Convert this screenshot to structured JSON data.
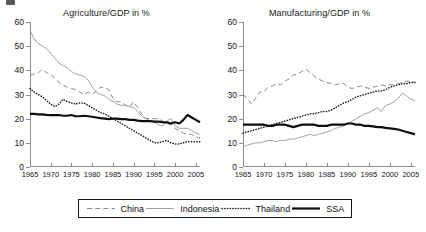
{
  "figure": {
    "caption_stub": "",
    "legend_position": "bottom-center-boxed"
  },
  "panels": [
    {
      "id": "agriculture",
      "title": "Agriculture/GDP in %"
    },
    {
      "id": "manufacturing",
      "title": "Manufacturing/GDP in %"
    }
  ],
  "legend": {
    "items": [
      {
        "label": "China",
        "style": "dashed"
      },
      {
        "label": "Indonesia",
        "style": "thin-solid"
      },
      {
        "label": "Thailand",
        "style": "dotted"
      },
      {
        "label": "SSA",
        "style": "thick-solid"
      }
    ]
  },
  "axis": {
    "y_ticks": [
      0,
      10,
      20,
      30,
      40,
      50,
      60
    ],
    "x_ticks": [
      1965,
      1970,
      1975,
      1980,
      1985,
      1990,
      1995,
      2000,
      2005
    ]
  },
  "colors": {
    "axis": "#8e8e8e",
    "china": "#7a7a7a",
    "indonesia": "#8a8a8a",
    "thailand": "#1a1a1a",
    "ssa": "#0d0d0d",
    "text": "#161616"
  },
  "chart_data": [
    {
      "type": "line",
      "title": "Agriculture/GDP in %",
      "xlabel": "",
      "ylabel": "",
      "xlim": [
        1965,
        2006
      ],
      "ylim": [
        0,
        60
      ],
      "grid": false,
      "legend": "bottom",
      "x": [
        1965,
        1966,
        1967,
        1968,
        1969,
        1970,
        1971,
        1972,
        1973,
        1974,
        1975,
        1976,
        1977,
        1978,
        1979,
        1980,
        1981,
        1982,
        1983,
        1984,
        1985,
        1986,
        1987,
        1988,
        1989,
        1990,
        1991,
        1992,
        1993,
        1994,
        1995,
        1996,
        1997,
        1998,
        1999,
        2000,
        2001,
        2002,
        2003,
        2004,
        2005,
        2006
      ],
      "series": [
        {
          "name": "China",
          "style": "dashed",
          "values": [
            38,
            38.5,
            39,
            40.5,
            39,
            38.5,
            36.5,
            35,
            34,
            33,
            32.5,
            32,
            31,
            30,
            31,
            30,
            31.5,
            33,
            33,
            32,
            28.5,
            27,
            27,
            25.5,
            25,
            27,
            24.5,
            22,
            20,
            20,
            20,
            20,
            19,
            18,
            17.5,
            16,
            15,
            14,
            13.5,
            13.5,
            12.5,
            12
          ]
        },
        {
          "name": "Indonesia",
          "style": "thin-solid",
          "values": [
            56.5,
            53,
            51,
            50,
            49,
            47,
            45,
            43,
            42,
            41,
            39.5,
            38.5,
            38,
            37.5,
            36,
            33,
            31,
            30,
            29.5,
            28,
            27,
            26,
            25.5,
            25.5,
            25,
            24.5,
            23,
            21,
            20,
            19,
            18.5,
            17.5,
            17,
            19,
            20,
            17,
            16,
            16,
            16,
            15,
            14,
            13.5
          ]
        },
        {
          "name": "Thailand",
          "style": "dotted",
          "values": [
            32.5,
            31,
            30,
            29,
            27.5,
            26,
            25,
            26,
            28,
            27,
            26.5,
            26,
            26.5,
            26.5,
            25.5,
            24.5,
            23.5,
            22.5,
            22,
            21,
            20,
            19,
            18,
            17,
            16,
            15,
            14,
            13,
            12,
            11,
            10,
            10,
            10.5,
            11,
            10,
            9.5,
            9.5,
            10,
            10.5,
            10.5,
            10.5,
            10.5
          ]
        },
        {
          "name": "SSA",
          "style": "thick-solid",
          "values": [
            22,
            22,
            21.8,
            21.8,
            21.6,
            21.5,
            21.5,
            21.5,
            21.2,
            21.2,
            21.5,
            21,
            21,
            21.2,
            21,
            20.8,
            20.5,
            20.2,
            20,
            19.8,
            20,
            20,
            19.8,
            19.8,
            19.5,
            19.5,
            19.2,
            19,
            19,
            19,
            18.8,
            18.8,
            18.5,
            18.5,
            18,
            18.5,
            18,
            19.5,
            21.5,
            20.5,
            19.5,
            18.5
          ]
        }
      ]
    },
    {
      "type": "line",
      "title": "Manufacturing/GDP in %",
      "xlabel": "",
      "ylabel": "",
      "xlim": [
        1965,
        2006
      ],
      "ylim": [
        0,
        60
      ],
      "grid": false,
      "legend": "bottom",
      "x": [
        1965,
        1966,
        1967,
        1968,
        1969,
        1970,
        1971,
        1972,
        1973,
        1974,
        1975,
        1976,
        1977,
        1978,
        1979,
        1980,
        1981,
        1982,
        1983,
        1984,
        1985,
        1986,
        1987,
        1988,
        1989,
        1990,
        1991,
        1992,
        1993,
        1994,
        1995,
        1996,
        1997,
        1998,
        1999,
        2000,
        2001,
        2002,
        2003,
        2004,
        2005,
        2006
      ],
      "series": [
        {
          "name": "China",
          "style": "dashed",
          "values": [
            30,
            28.5,
            26,
            28.5,
            31,
            31,
            33,
            33.5,
            34.5,
            34,
            35.5,
            36.5,
            38,
            38.5,
            39.5,
            40.5,
            39,
            37.5,
            36.5,
            35.5,
            35,
            34.5,
            34,
            34.5,
            34.5,
            33,
            32.5,
            33,
            33.5,
            33,
            32.5,
            33,
            33.5,
            34,
            33.5,
            34,
            34,
            34.5,
            35,
            35.5,
            35.5,
            35
          ]
        },
        {
          "name": "Indonesia",
          "style": "thin-solid",
          "values": [
            8.5,
            9,
            9.5,
            10,
            10,
            10.5,
            11,
            11,
            10.5,
            11,
            11,
            11.5,
            11.5,
            12,
            12.5,
            13,
            13.5,
            13,
            13.5,
            14,
            14.5,
            15,
            16,
            16.5,
            17,
            18,
            19,
            20,
            21,
            22,
            22.5,
            23.5,
            24.5,
            23,
            25.5,
            26,
            27,
            28.5,
            30.5,
            29.5,
            28,
            27.5
          ]
        },
        {
          "name": "Thailand",
          "style": "dotted",
          "values": [
            14,
            14.5,
            15,
            15.5,
            16,
            16.5,
            17,
            17.5,
            18,
            18.5,
            19,
            19.5,
            20,
            20.5,
            21,
            21.5,
            22,
            22,
            22.5,
            23,
            23,
            23.5,
            24.5,
            25.5,
            26.5,
            27,
            28,
            29,
            29.5,
            30,
            30.5,
            31,
            31.5,
            31.5,
            32,
            33,
            33.5,
            34,
            34.5,
            34.5,
            35,
            35
          ]
        },
        {
          "name": "SSA",
          "style": "thick-solid",
          "values": [
            17.5,
            17.5,
            17.5,
            17.5,
            17.5,
            17.5,
            17,
            17,
            17.5,
            17.5,
            17.5,
            17,
            16.5,
            17,
            17.5,
            17.5,
            17.5,
            17.5,
            17,
            17,
            17,
            17.5,
            17.5,
            17.5,
            17.5,
            18,
            18,
            17.5,
            17.5,
            17,
            17,
            16.8,
            16.5,
            16.5,
            16.2,
            16,
            15.8,
            15.5,
            15,
            14.5,
            14,
            13.5
          ]
        }
      ]
    }
  ]
}
